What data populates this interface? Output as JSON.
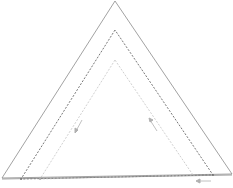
{
  "diagram": {
    "type": "nested-triangles",
    "background": "#ffffff",
    "triangles": [
      {
        "name": "outer",
        "style": "solid",
        "color": "#8a8a8a",
        "points": "115,1 2,178 232,174"
      },
      {
        "name": "middle",
        "style": "dashed",
        "color": "#555555",
        "points": "115,30 21,179 213,175"
      },
      {
        "name": "inner",
        "style": "dashed",
        "color": "#c4c4c4",
        "points": "115,60 40,179 193,175"
      }
    ],
    "baseline": {
      "color": "#8a8a8a",
      "x1": 2,
      "y1": 179,
      "x2": 232,
      "y2": 175
    },
    "arrows": [
      {
        "name": "left-side-arrow",
        "color": "#b0b0b0",
        "direction": "down-left"
      },
      {
        "name": "right-side-arrow",
        "color": "#b0b0b0",
        "direction": "up-left"
      },
      {
        "name": "bottom-arrow",
        "color": "#b0b0b0",
        "direction": "left"
      }
    ]
  }
}
